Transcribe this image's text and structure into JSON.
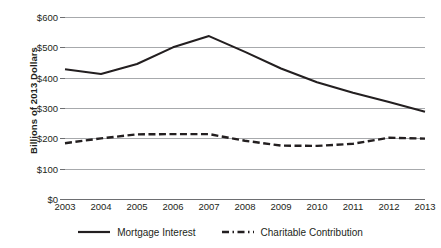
{
  "chart_data": {
    "type": "line",
    "title": "",
    "xlabel": "",
    "ylabel": "Billions of 2013 Dollars",
    "x": [
      2003,
      2004,
      2005,
      2006,
      2007,
      2008,
      2009,
      2010,
      2011,
      2012,
      2013
    ],
    "categories": [
      "2003",
      "2004",
      "2005",
      "2006",
      "2007",
      "2008",
      "2009",
      "2010",
      "2011",
      "2012",
      "2013"
    ],
    "ylim": [
      0,
      600
    ],
    "ytick_values": [
      0,
      100,
      200,
      300,
      400,
      500,
      600
    ],
    "ytick_labels": [
      "$0",
      "$100",
      "$200",
      "$300",
      "$400",
      "$500",
      "$600"
    ],
    "grid": "horizontal",
    "legend_position": "bottom",
    "series": [
      {
        "name": "Mortgage Interest",
        "style": "solid",
        "color": "#231f20",
        "values": [
          428,
          412,
          445,
          500,
          537,
          485,
          430,
          385,
          350,
          320,
          288
        ]
      },
      {
        "name": "Charitable Contribution",
        "style": "dash-dot",
        "color": "#231f20",
        "values": [
          184,
          200,
          213,
          214,
          214,
          192,
          176,
          175,
          182,
          202,
          199
        ]
      }
    ]
  },
  "legend": {
    "items": [
      {
        "label": "Mortgage Interest",
        "style": "solid"
      },
      {
        "label": "Charitable Contribution",
        "style": "dash-dot"
      }
    ]
  }
}
